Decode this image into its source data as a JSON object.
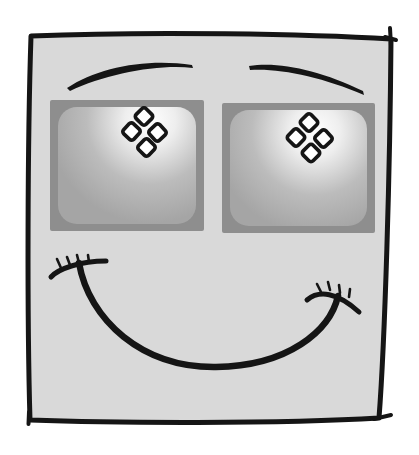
{
  "illustration": {
    "subject": "smiling-face-with-crt-monitor-eyes",
    "style": "hand-drawn-cartoon"
  },
  "colors": {
    "page_bg": "#ffffff",
    "ink": "#151515",
    "face_fill": "#d9d9d9",
    "bezel": "#8e8e8e",
    "screen_base": "#a5a5a5",
    "screen_mid": "#bcbcbc",
    "screen_light": "#eeeeee",
    "glow": "#ffffff",
    "diamond_fill": "#ffffff"
  },
  "structure": {
    "eye_count": 2,
    "diamonds_per_eye": 4,
    "eyebrow_count": 2,
    "smile_corner_tick_count": 8
  }
}
